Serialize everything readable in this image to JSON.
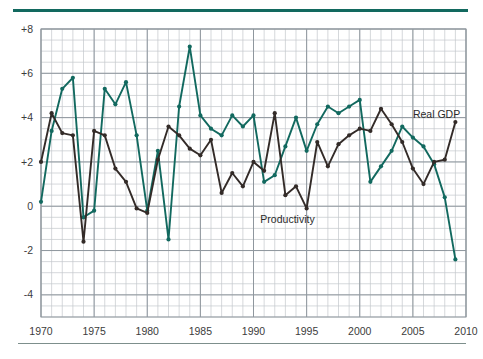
{
  "chart_data": {
    "type": "line",
    "title": "",
    "subtitle": "",
    "xlabel": "",
    "ylabel": "",
    "xlim": [
      1970,
      2010
    ],
    "ylim": [
      -5,
      8
    ],
    "grid": true,
    "grid_major_y": [
      -4,
      -2,
      0,
      2,
      4,
      6,
      8
    ],
    "grid_minor_y_step": 0.5,
    "grid_minor_x_step": 1,
    "y_tick_labels": [
      "+8",
      "+6",
      "+4",
      "+2",
      "0",
      "-2",
      "-4"
    ],
    "y_tick_values": [
      8,
      6,
      4,
      2,
      0,
      -2,
      -4
    ],
    "x_tick_labels": [
      "1970",
      "1975",
      "1980",
      "1985",
      "1990",
      "1995",
      "2000",
      "2005",
      "2010"
    ],
    "x_tick_values": [
      1970,
      1975,
      1980,
      1985,
      1990,
      1995,
      2000,
      2005,
      2010
    ],
    "legend_position": "inline-annotation",
    "x": [
      1970,
      1971,
      1972,
      1973,
      1974,
      1975,
      1976,
      1977,
      1978,
      1979,
      1980,
      1981,
      1982,
      1983,
      1984,
      1985,
      1986,
      1987,
      1988,
      1989,
      1990,
      1991,
      1992,
      1993,
      1994,
      1995,
      1996,
      1997,
      1998,
      1999,
      2000,
      2001,
      2002,
      2003,
      2004,
      2005,
      2006,
      2007,
      2008,
      2009
    ],
    "series": [
      {
        "name": "Real GDP",
        "color": "#12695f",
        "label_x": 2005.0,
        "label_y": 4.0,
        "values": [
          0.2,
          3.4,
          5.3,
          5.8,
          -0.5,
          -0.2,
          5.3,
          4.6,
          5.6,
          3.2,
          -0.2,
          2.5,
          -1.5,
          4.5,
          7.2,
          4.1,
          3.5,
          3.2,
          4.1,
          3.6,
          4.1,
          1.1,
          1.4,
          2.7,
          4.0,
          2.5,
          3.7,
          4.5,
          4.2,
          4.5,
          4.8,
          1.1,
          1.8,
          2.5,
          3.6,
          3.1,
          2.7,
          1.9,
          0.4,
          -2.4
        ]
      },
      {
        "name": "Productivity",
        "color": "#332b28",
        "label_x": 1993.2,
        "label_y": -0.75,
        "values": [
          2.0,
          4.2,
          3.3,
          3.2,
          -1.6,
          3.4,
          3.2,
          1.7,
          1.1,
          -0.1,
          -0.3,
          2.1,
          3.6,
          3.2,
          2.6,
          2.3,
          3.0,
          0.6,
          1.5,
          0.9,
          2.0,
          1.6,
          4.2,
          0.5,
          0.9,
          -0.1,
          2.9,
          1.8,
          2.8,
          3.2,
          3.5,
          3.4,
          4.4,
          3.7,
          2.9,
          1.7,
          1.0,
          2.0,
          2.1,
          3.8
        ]
      }
    ]
  }
}
